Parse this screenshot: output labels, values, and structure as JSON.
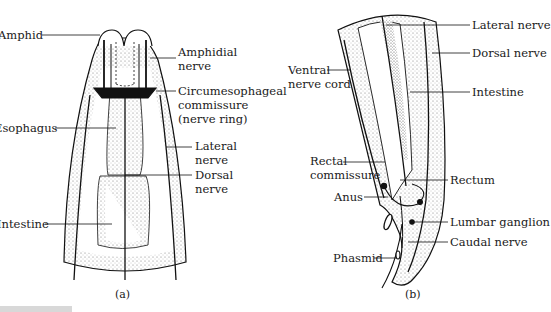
{
  "panel_a": {
    "caption": "(a)",
    "labels": {
      "amphid": "Amphid",
      "amphidial_nerve_1": "Amphidial",
      "amphidial_nerve_2": "nerve",
      "circum_1": "Circumesophageal",
      "circum_2": "commissure",
      "circum_3": "(nerve ring)",
      "esophagus": "Esophagus",
      "lateral_nerve_1": "Lateral",
      "lateral_nerve_2": "nerve",
      "dorsal_nerve_1": "Dorsal",
      "dorsal_nerve_2": "nerve",
      "intestine": "Intestine"
    }
  },
  "panel_b": {
    "caption": "(b)",
    "labels": {
      "lateral_nerve": "Lateral nerve",
      "dorsal_nerve": "Dorsal nerve",
      "ventral_1": "Ventral",
      "ventral_2": "nerve cord",
      "intestine": "Intestine",
      "rectal_1": "Rectal",
      "rectal_2": "commissure",
      "rectum": "Rectum",
      "anus": "Anus",
      "lumbar_ganglion": "Lumbar ganglion",
      "caudal_nerve": "Caudal nerve",
      "phasmid": "Phasmid"
    }
  },
  "colors": {
    "ink": "#111111",
    "stipple": "#bdbdbd",
    "background": "#ffffff"
  }
}
